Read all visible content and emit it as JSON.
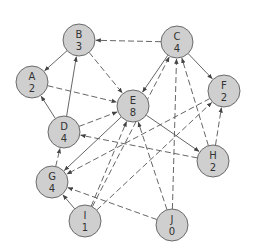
{
  "diagram": {
    "type": "directed-graph",
    "node_radius": 16,
    "colors": {
      "node_fill": "#cfcfcf",
      "node_stroke": "#6a6a6a",
      "edge": "#555555",
      "text": "#333333",
      "background": "#ffffff"
    },
    "nodes": [
      {
        "id": "A",
        "value": "2",
        "x": 32,
        "y": 82
      },
      {
        "id": "B",
        "value": "3",
        "x": 79,
        "y": 40
      },
      {
        "id": "C",
        "value": "4",
        "x": 177,
        "y": 42
      },
      {
        "id": "D",
        "value": "4",
        "x": 64,
        "y": 132
      },
      {
        "id": "E",
        "value": "8",
        "x": 133,
        "y": 106
      },
      {
        "id": "F",
        "value": "2",
        "x": 224,
        "y": 91
      },
      {
        "id": "G",
        "value": "4",
        "x": 52,
        "y": 182
      },
      {
        "id": "H",
        "value": "2",
        "x": 213,
        "y": 161
      },
      {
        "id": "I",
        "value": "1",
        "x": 85,
        "y": 221
      },
      {
        "id": "J",
        "value": "0",
        "x": 172,
        "y": 225
      }
    ],
    "edges": [
      {
        "from": "C",
        "to": "B",
        "style": "dashed"
      },
      {
        "from": "B",
        "to": "A",
        "style": "solid"
      },
      {
        "from": "D",
        "to": "A",
        "style": "solid"
      },
      {
        "from": "D",
        "to": "B",
        "style": "solid"
      },
      {
        "from": "B",
        "to": "E",
        "style": "dashed"
      },
      {
        "from": "A",
        "to": "E",
        "style": "dashed"
      },
      {
        "from": "C",
        "to": "E",
        "style": "solid"
      },
      {
        "from": "C",
        "to": "F",
        "style": "solid"
      },
      {
        "from": "D",
        "to": "E",
        "style": "dashed"
      },
      {
        "from": "E",
        "to": "H",
        "style": "solid"
      },
      {
        "from": "H",
        "to": "D",
        "style": "dashed"
      },
      {
        "from": "G",
        "to": "D",
        "style": "dashed"
      },
      {
        "from": "E",
        "to": "G",
        "style": "solid"
      },
      {
        "from": "F",
        "to": "G",
        "style": "dashed"
      },
      {
        "from": "I",
        "to": "G",
        "style": "solid"
      },
      {
        "from": "J",
        "to": "G",
        "style": "dashed"
      },
      {
        "from": "I",
        "to": "C",
        "style": "dashed"
      },
      {
        "from": "I",
        "to": "F",
        "style": "dashed"
      },
      {
        "from": "J",
        "to": "C",
        "style": "dashed"
      },
      {
        "from": "J",
        "to": "E",
        "style": "dashed"
      },
      {
        "from": "H",
        "to": "C",
        "style": "dashed"
      },
      {
        "from": "H",
        "to": "F",
        "style": "dashed"
      },
      {
        "from": "I",
        "to": "E",
        "style": "dashed"
      }
    ]
  }
}
